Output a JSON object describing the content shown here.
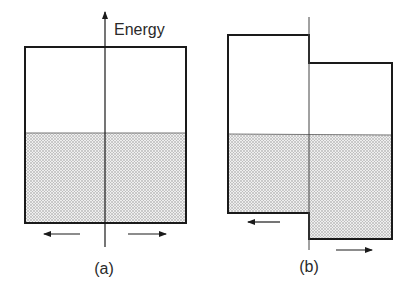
{
  "axis_label": "Energy",
  "panels": [
    {
      "label": "(a)",
      "description": "Two identical boxes filled to the same level; symmetric arrows"
    },
    {
      "label": "(b)",
      "description": "Right box shifted down relative to left box; filled to common level"
    }
  ],
  "colors": {
    "line": "#1a1a1a",
    "fill": "#d9d9d9",
    "background": "#ffffff"
  }
}
